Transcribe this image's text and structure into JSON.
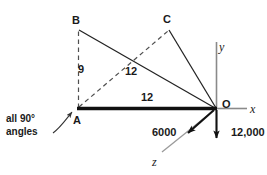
{
  "figure": {
    "note": "all 90°\nangles",
    "note_line1": "all 90°",
    "note_line2": "angles"
  },
  "points": {
    "A": "A",
    "B": "B",
    "C": "C",
    "O": "O"
  },
  "axes": {
    "x": "x",
    "y": "y",
    "z": "z"
  },
  "dimensions": {
    "AB": "9",
    "AC": "12",
    "AO": "12"
  },
  "loads": {
    "z_force": "6000",
    "y_force": "12,000"
  },
  "colors": {
    "line": "#1a1a1a",
    "thin_line": "#4d4d4d",
    "dashed_line": "#555555",
    "axis": "#6b6b6b",
    "background": "#ffffff",
    "text": "#1a1a1a"
  },
  "geometry": {
    "A": [
      78,
      108
    ],
    "B": [
      78,
      30
    ],
    "C": [
      169,
      30
    ],
    "O": [
      216,
      108
    ],
    "y_axis_top": [
      216,
      42
    ],
    "x_axis_end": [
      246,
      108
    ],
    "z_arrow_tip": [
      185,
      136
    ],
    "z_axis_end": [
      163,
      152
    ],
    "y_arrow_tip": [
      216,
      142
    ]
  }
}
